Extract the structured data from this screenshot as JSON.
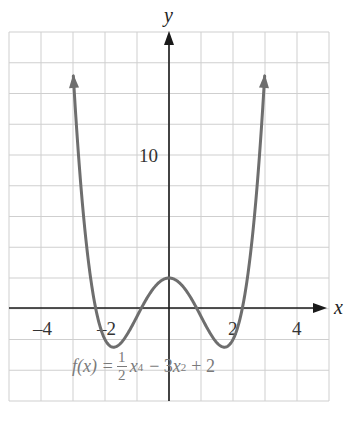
{
  "chart_data": {
    "type": "line",
    "title": "",
    "function": "f(x) = (1/2)x^4 - 3x^2 + 2",
    "xlabel": "x",
    "ylabel": "y",
    "xlim": [
      -5,
      5
    ],
    "ylim": [
      -6,
      18
    ],
    "grid": true,
    "grid_step": {
      "x": 1,
      "y": 2
    },
    "x_tick_labels": [
      {
        "value": -4,
        "label": "–4"
      },
      {
        "value": -2,
        "label": "–2"
      },
      {
        "value": 2,
        "label": "2"
      },
      {
        "value": 4,
        "label": "4"
      }
    ],
    "y_tick_labels": [
      {
        "value": 10,
        "label": "10"
      }
    ],
    "series": [
      {
        "name": "f(x) = ½x⁴ − 3x² + 2",
        "color": "#6e6e6e",
        "domain": [
          -2.99,
          2.99
        ],
        "key_points": [
          {
            "x": -1.732,
            "y": -2.5,
            "note": "local minimum"
          },
          {
            "x": 0,
            "y": 2,
            "note": "local maximum"
          },
          {
            "x": 1.732,
            "y": -2.5,
            "note": "local minimum"
          },
          {
            "x": -2.33,
            "y": 0,
            "note": "x-intercept"
          },
          {
            "x": -0.86,
            "y": 0,
            "note": "x-intercept"
          },
          {
            "x": 0.86,
            "y": 0,
            "note": "x-intercept"
          },
          {
            "x": 2.33,
            "y": 0,
            "note": "x-intercept"
          }
        ],
        "end_arrows": true
      }
    ],
    "annotations": [
      {
        "text": "f(x) = ½x⁴ − 3x² + 2",
        "position": "below x-axis, centered"
      }
    ]
  },
  "labels": {
    "x_axis": "x",
    "y_axis": "y",
    "formula": {
      "lhs": "f(x) =",
      "frac_num": "1",
      "frac_den": "2",
      "x4_base": "x",
      "x4_exp": "4",
      "mid": "− 3",
      "x2_base": "x",
      "x2_exp": "2",
      "tail": "+ 2"
    }
  },
  "colors": {
    "grid": "#cfcfcf",
    "axis": "#1a1a1a",
    "curve": "#6e6e6e",
    "formula_text": "#7a7a7a"
  }
}
